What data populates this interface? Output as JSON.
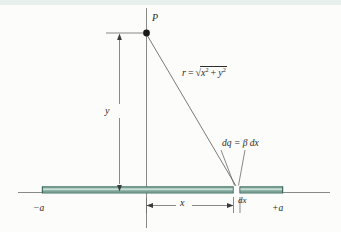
{
  "figure": {
    "background_color": "#fcfcfa",
    "rod_color": "#6f9b90",
    "rod_highlight_color": "#cfe0da",
    "line_color": "#6b6b6b",
    "text_color": "#2b2b2b"
  },
  "labels": {
    "point_p": "P",
    "height_y": "y",
    "distance_r_prefix": "r",
    "distance_r_equals": "=",
    "distance_r_radicand_x": "x",
    "distance_r_exp_x": "2",
    "distance_r_plus": "+",
    "distance_r_radicand_y": "y",
    "distance_r_exp_y": "2",
    "charge_element": "dq  =  β dx",
    "horizontal_x": "x",
    "element_dx": "dx",
    "rod_left_end": "−a",
    "rod_right_end": "+a"
  },
  "geometry": {
    "point_p_x": 146,
    "point_p_y": 33,
    "origin_x": 146,
    "axis_y": 192,
    "element_x": 234,
    "rod_left_x": 42,
    "rod_right_x": 283,
    "vertical_axis_top": 8,
    "vertical_axis_bottom": 228,
    "horizontal_axis_left": 18,
    "horizontal_axis_right": 330
  }
}
